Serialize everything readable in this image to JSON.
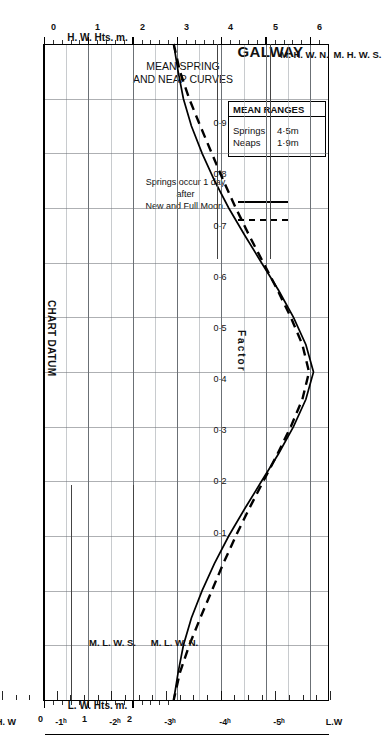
{
  "title": "GALWAY",
  "subtitle_lines": [
    "MEAN SPRING",
    "AND NEAP CURVES"
  ],
  "legend": {
    "header": "MEAN RANGES",
    "rows": [
      {
        "name": "Springs",
        "value": "4·5m",
        "style": "solid"
      },
      {
        "name": "Neaps",
        "value": "1·9m",
        "style": "dashed"
      }
    ]
  },
  "note_lines": [
    "Springs occur 1 day",
    "after",
    "New and Full Moon."
  ],
  "axes": {
    "hw_axis_title": "H. W. Hts. m.",
    "lw_axis_title": "L. W. Hts. m.",
    "hw_ticks": [
      "0",
      "1",
      "2",
      "3",
      "4",
      "5",
      "6"
    ],
    "lw_ticks": [
      "0",
      "1",
      "2"
    ],
    "time_labels": [
      "L.W",
      "-5ʰ",
      "-4ʰ",
      "-3ʰ",
      "-2ʰ",
      "-1ʰ",
      "H. W",
      "+1ʰ",
      "+2ʰ",
      "+3ʰ",
      "+4ʰ",
      "+5ʰ",
      "L. W"
    ],
    "datum_label": "CHART DATUM"
  },
  "factor": {
    "title": "Factor",
    "labels": [
      "0·9",
      "0·8",
      "0·7",
      "0·6",
      "0·5",
      "0·4",
      "0·3",
      "0·2",
      "0·1"
    ]
  },
  "markers": [
    {
      "label": "M. H. W. S.",
      "value": 5.1,
      "side": "hw"
    },
    {
      "label": "M. H. W. N.",
      "value": 3.9,
      "side": "hw"
    },
    {
      "label": "M. L. W. N.",
      "value": 2.0,
      "side": "lw"
    },
    {
      "label": "M. L. W. S.",
      "value": 0.6,
      "side": "lw"
    }
  ],
  "chart_data": {
    "type": "line",
    "xlabel": "Time relative to High Water (hours)",
    "ylabel": "Height (m) / Factor",
    "xlim": [
      -6,
      6
    ],
    "ylim": [
      0,
      6.4
    ],
    "grid": true,
    "legend_position": "top-left",
    "x": [
      -6,
      -5.5,
      -5,
      -4.5,
      -4,
      -3.5,
      -3,
      -2.5,
      -2,
      -1.5,
      -1,
      -0.5,
      0,
      0.5,
      1,
      1.5,
      2,
      2.5,
      3,
      3.5,
      4,
      4.5,
      5,
      5.5,
      6
    ],
    "factor_curve": [
      0.0,
      0.02,
      0.05,
      0.09,
      0.15,
      0.22,
      0.3,
      0.39,
      0.5,
      0.62,
      0.76,
      0.9,
      1.0,
      0.9,
      0.76,
      0.62,
      0.5,
      0.39,
      0.3,
      0.22,
      0.15,
      0.09,
      0.05,
      0.02,
      0.0
    ],
    "series": [
      {
        "name": "Springs 4·5m",
        "style": "solid",
        "values": [
          2.9,
          3.0,
          3.12,
          3.3,
          3.54,
          3.82,
          4.14,
          4.5,
          4.88,
          5.26,
          5.6,
          5.88,
          6.05,
          5.88,
          5.6,
          5.26,
          4.88,
          4.5,
          4.14,
          3.82,
          3.54,
          3.3,
          3.12,
          3.0,
          2.9
        ]
      },
      {
        "name": "Neaps 1·9m",
        "style": "dashed",
        "values": [
          2.9,
          3.04,
          3.25,
          3.5,
          3.76,
          4.02,
          4.3,
          4.6,
          4.92,
          5.24,
          5.54,
          5.8,
          5.95,
          5.8,
          5.54,
          5.24,
          4.92,
          4.6,
          4.3,
          4.02,
          3.76,
          3.5,
          3.25,
          3.04,
          2.9
        ]
      }
    ],
    "annotations": [
      {
        "text": "M. H. W. S.",
        "value": 5.1
      },
      {
        "text": "M. H. W. N.",
        "value": 3.9
      },
      {
        "text": "M. L. W. N.",
        "value": 2.0
      },
      {
        "text": "M. L. W. S.",
        "value": 0.6
      },
      {
        "text": "CHART DATUM",
        "value": 0.0
      }
    ]
  }
}
